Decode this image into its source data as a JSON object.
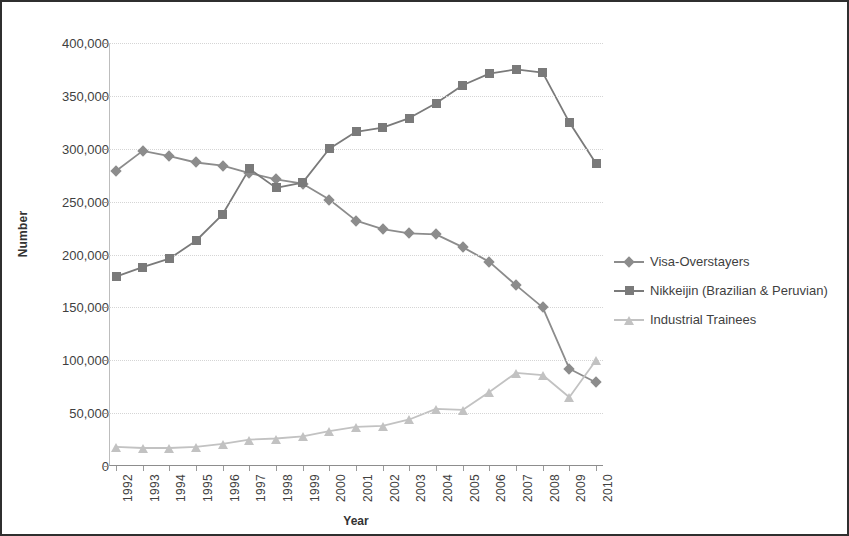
{
  "chart_data": {
    "type": "line",
    "title": "",
    "xlabel": "Year",
    "ylabel": "Number",
    "ylim": [
      0,
      400000
    ],
    "yticks": [
      0,
      50000,
      100000,
      150000,
      200000,
      250000,
      300000,
      350000,
      400000
    ],
    "ytick_labels": [
      "0",
      "50,000",
      "100,000",
      "150,000",
      "200,000",
      "250,000",
      "300,000",
      "350,000",
      "400,000"
    ],
    "grid": true,
    "legend_position": "right",
    "categories": [
      1992,
      1993,
      1994,
      1995,
      1996,
      1997,
      1998,
      1999,
      2000,
      2001,
      2002,
      2003,
      2004,
      2005,
      2006,
      2007,
      2008,
      2009,
      2010
    ],
    "x": [
      "1992",
      "1993",
      "1994",
      "1995",
      "1996",
      "1997",
      "1998",
      "1999",
      "2000",
      "2001",
      "2002",
      "2003",
      "2004",
      "2005",
      "2006",
      "2007",
      "2008",
      "2009",
      "2010"
    ],
    "series": [
      {
        "name": "Visa-Overstayers",
        "marker": "diamond",
        "color": "#8c8c8c",
        "values": [
          279000,
          298000,
          293000,
          287000,
          284000,
          277000,
          271000,
          267000,
          252000,
          232000,
          224000,
          220000,
          219000,
          207000,
          193000,
          171000,
          150000,
          92000,
          79000
        ]
      },
      {
        "name": "Nikkeijin (Brazilian & Peruvian)",
        "marker": "square",
        "color": "#7a7a7a",
        "values": [
          179000,
          188000,
          196000,
          213000,
          238000,
          281000,
          263000,
          268000,
          300000,
          316000,
          320000,
          329000,
          343000,
          360000,
          371000,
          375000,
          372000,
          325000,
          286000
        ]
      },
      {
        "name": "Industrial Trainees",
        "marker": "triangle",
        "color": "#c2c2c2",
        "values": [
          18000,
          17000,
          17000,
          18000,
          21000,
          25000,
          26000,
          28000,
          33000,
          37000,
          38000,
          44000,
          54000,
          53000,
          70000,
          88000,
          86000,
          65000,
          100000
        ]
      }
    ]
  },
  "axes": {
    "ylabel": "Number",
    "xlabel": "Year"
  }
}
